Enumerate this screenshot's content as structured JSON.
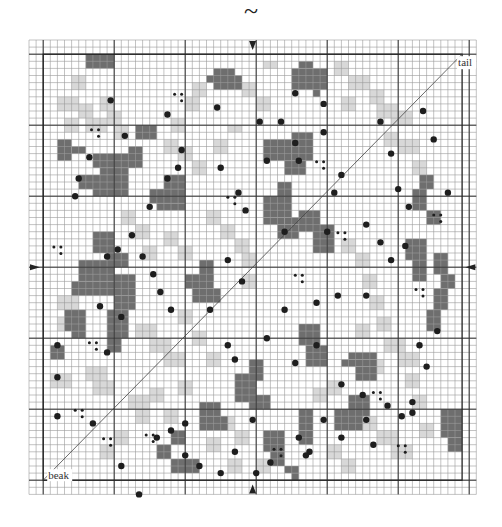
{
  "header": {
    "symbol": "~"
  },
  "labels": {
    "tail": "tail",
    "beak": "beak"
  },
  "colors": {
    "background": "#ffffff",
    "grid_line": "#9a9a9a",
    "grid_bold": "#333333",
    "dark_block": "#6e6e6e",
    "light_block": "#d8d8d8",
    "dot": "#1e1e1e",
    "marker": "#222222"
  },
  "grid": {
    "origin_x": 29,
    "origin_y": 40,
    "cell": 7.1,
    "cols": 63,
    "rows": 64,
    "inner_box": {
      "c0": 2,
      "r0": 2,
      "c1": 61,
      "r1": 62
    },
    "bold_every": 10,
    "bold_offset": 2
  },
  "markers": [
    {
      "side": "top",
      "col": 31.5
    },
    {
      "side": "bottom",
      "col": 31.5
    },
    {
      "side": "left",
      "row": 32
    },
    {
      "side": "right",
      "row": 32
    }
  ],
  "diagonal": {
    "from": {
      "c": 2,
      "r": 62
    },
    "to": {
      "c": 61,
      "r": 2
    }
  },
  "dark_blocks": [
    [
      8,
      2,
      4,
      2
    ],
    [
      10,
      2,
      2,
      1
    ],
    [
      25,
      5,
      2,
      1
    ],
    [
      26,
      4,
      3,
      3
    ],
    [
      29,
      5,
      1,
      2
    ],
    [
      37,
      4,
      5,
      3
    ],
    [
      38,
      3,
      2,
      1
    ],
    [
      40,
      7,
      1,
      1
    ],
    [
      4,
      14,
      2,
      3
    ],
    [
      6,
      15,
      2,
      1
    ],
    [
      9,
      16,
      6,
      2
    ],
    [
      10,
      18,
      4,
      1
    ],
    [
      14,
      15,
      2,
      3
    ],
    [
      15,
      12,
      3,
      2
    ],
    [
      37,
      13,
      3,
      4
    ],
    [
      33,
      14,
      4,
      3
    ],
    [
      36,
      17,
      3,
      2
    ],
    [
      7,
      19,
      7,
      2
    ],
    [
      9,
      21,
      5,
      1
    ],
    [
      17,
      21,
      5,
      2
    ],
    [
      19,
      19,
      3,
      2
    ],
    [
      18,
      23,
      4,
      1
    ],
    [
      33,
      22,
      4,
      3
    ],
    [
      35,
      20,
      2,
      2
    ],
    [
      33,
      25,
      3,
      1
    ],
    [
      36,
      25,
      3,
      1
    ],
    [
      35,
      26,
      3,
      2
    ],
    [
      9,
      27,
      3,
      3
    ],
    [
      11,
      30,
      3,
      2
    ],
    [
      12,
      33,
      3,
      3
    ],
    [
      12,
      36,
      3,
      2
    ],
    [
      38,
      24,
      3,
      3
    ],
    [
      40,
      26,
      3,
      4
    ],
    [
      7,
      31,
      5,
      3
    ],
    [
      6,
      34,
      6,
      2
    ],
    [
      22,
      33,
      4,
      2
    ],
    [
      24,
      31,
      2,
      3
    ],
    [
      23,
      35,
      4,
      2
    ],
    [
      54,
      21,
      2,
      3
    ],
    [
      55,
      19,
      2,
      2
    ],
    [
      56,
      24,
      2,
      2
    ],
    [
      53,
      28,
      3,
      3
    ],
    [
      54,
      31,
      2,
      3
    ],
    [
      57,
      30,
      2,
      3
    ],
    [
      58,
      33,
      2,
      2
    ],
    [
      5,
      38,
      3,
      3
    ],
    [
      6,
      41,
      2,
      1
    ],
    [
      11,
      38,
      3,
      4
    ],
    [
      11,
      42,
      2,
      2
    ],
    [
      3,
      43,
      2,
      2
    ],
    [
      38,
      40,
      3,
      3
    ],
    [
      39,
      43,
      3,
      3
    ],
    [
      45,
      44,
      4,
      1
    ],
    [
      44,
      45,
      5,
      1
    ],
    [
      46,
      46,
      3,
      2
    ],
    [
      56,
      38,
      2,
      3
    ],
    [
      57,
      35,
      2,
      3
    ],
    [
      43,
      52,
      4,
      3
    ],
    [
      45,
      50,
      3,
      3
    ],
    [
      29,
      47,
      3,
      4
    ],
    [
      31,
      45,
      2,
      3
    ],
    [
      31,
      50,
      3,
      2
    ],
    [
      24,
      51,
      3,
      2
    ],
    [
      24,
      53,
      4,
      2
    ],
    [
      20,
      55,
      2,
      2
    ],
    [
      33,
      55,
      3,
      3
    ],
    [
      34,
      58,
      2,
      2
    ],
    [
      36,
      60,
      2,
      1
    ],
    [
      37,
      61,
      1,
      1
    ],
    [
      20,
      59,
      4,
      2
    ],
    [
      18,
      57,
      2,
      2
    ],
    [
      38,
      52,
      2,
      3
    ],
    [
      38,
      55,
      2,
      2
    ],
    [
      58,
      52,
      3,
      4
    ],
    [
      59,
      56,
      2,
      2
    ]
  ],
  "light_blocks": [
    [
      6,
      5,
      2,
      2
    ],
    [
      4,
      8,
      3,
      2
    ],
    [
      7,
      9,
      2,
      2
    ],
    [
      8,
      11,
      3,
      2
    ],
    [
      5,
      11,
      2,
      2
    ],
    [
      10,
      8,
      2,
      2
    ],
    [
      11,
      10,
      2,
      2
    ],
    [
      12,
      12,
      2,
      2
    ],
    [
      23,
      6,
      2,
      2
    ],
    [
      22,
      8,
      2,
      2
    ],
    [
      20,
      11,
      2,
      2
    ],
    [
      30,
      6,
      2,
      2
    ],
    [
      33,
      3,
      2,
      1
    ],
    [
      32,
      8,
      2,
      2
    ],
    [
      43,
      3,
      2,
      2
    ],
    [
      45,
      5,
      3,
      2
    ],
    [
      44,
      8,
      2,
      2
    ],
    [
      48,
      7,
      2,
      2
    ],
    [
      49,
      9,
      3,
      2
    ],
    [
      51,
      10,
      3,
      2
    ],
    [
      52,
      14,
      3,
      2
    ],
    [
      50,
      13,
      2,
      2
    ],
    [
      54,
      17,
      2,
      2
    ],
    [
      19,
      14,
      2,
      2
    ],
    [
      21,
      15,
      2,
      2
    ],
    [
      23,
      17,
      2,
      2
    ],
    [
      26,
      14,
      2,
      2
    ],
    [
      28,
      12,
      2,
      1
    ],
    [
      13,
      24,
      2,
      2
    ],
    [
      15,
      26,
      2,
      2
    ],
    [
      16,
      29,
      2,
      2
    ],
    [
      19,
      27,
      2,
      2
    ],
    [
      21,
      29,
      2,
      2
    ],
    [
      25,
      24,
      2,
      2
    ],
    [
      27,
      26,
      2,
      2
    ],
    [
      29,
      28,
      2,
      2
    ],
    [
      30,
      30,
      2,
      2
    ],
    [
      30,
      33,
      2,
      2
    ],
    [
      44,
      28,
      2,
      2
    ],
    [
      46,
      30,
      2,
      2
    ],
    [
      47,
      33,
      2,
      2
    ],
    [
      48,
      36,
      2,
      2
    ],
    [
      49,
      39,
      2,
      2
    ],
    [
      4,
      36,
      3,
      2
    ],
    [
      4,
      39,
      2,
      2
    ],
    [
      3,
      47,
      3,
      2
    ],
    [
      8,
      46,
      3,
      2
    ],
    [
      9,
      48,
      3,
      2
    ],
    [
      15,
      40,
      3,
      2
    ],
    [
      17,
      42,
      3,
      2
    ],
    [
      19,
      44,
      3,
      2
    ],
    [
      21,
      38,
      2,
      2
    ],
    [
      23,
      41,
      2,
      2
    ],
    [
      25,
      44,
      2,
      2
    ],
    [
      50,
      42,
      3,
      2
    ],
    [
      52,
      44,
      3,
      2
    ],
    [
      53,
      47,
      2,
      2
    ],
    [
      46,
      40,
      2,
      2
    ],
    [
      48,
      45,
      2,
      2
    ],
    [
      17,
      49,
      2,
      2
    ],
    [
      19,
      52,
      2,
      2
    ],
    [
      21,
      48,
      2,
      2
    ],
    [
      25,
      56,
      2,
      2
    ],
    [
      27,
      53,
      2,
      2
    ],
    [
      29,
      55,
      2,
      2
    ],
    [
      12,
      55,
      2,
      2
    ],
    [
      10,
      57,
      2,
      2
    ],
    [
      14,
      50,
      3,
      2
    ],
    [
      15,
      52,
      2,
      2
    ],
    [
      40,
      49,
      2,
      2
    ],
    [
      42,
      48,
      2,
      2
    ],
    [
      47,
      53,
      2,
      2
    ],
    [
      49,
      55,
      3,
      2
    ],
    [
      51,
      57,
      3,
      2
    ],
    [
      54,
      50,
      2,
      2
    ],
    [
      55,
      54,
      2,
      2
    ],
    [
      32,
      59,
      2,
      2
    ],
    [
      28,
      59,
      2,
      2
    ],
    [
      42,
      57,
      2,
      2
    ],
    [
      44,
      59,
      2,
      2
    ]
  ],
  "dots": [
    [
      37.5,
      7.5
    ],
    [
      35.5,
      11.5
    ],
    [
      21.5,
      15.5
    ],
    [
      19.5,
      19.5
    ],
    [
      17,
      23.5
    ],
    [
      14.5,
      27.5
    ],
    [
      12.5,
      29.5
    ],
    [
      11,
      30.5
    ],
    [
      13.5,
      13.5
    ],
    [
      11.5,
      8.5
    ],
    [
      19.5,
      10.5
    ],
    [
      26.5,
      9.5
    ],
    [
      32.5,
      11.5
    ],
    [
      8.5,
      16.5
    ],
    [
      7,
      19.5
    ],
    [
      6.5,
      22
    ],
    [
      21,
      18
    ],
    [
      27,
      18
    ],
    [
      33.5,
      17
    ],
    [
      38,
      17
    ],
    [
      41.5,
      9
    ],
    [
      41.5,
      13
    ],
    [
      37.5,
      14.5
    ],
    [
      29.5,
      21.5
    ],
    [
      30.5,
      24
    ],
    [
      43,
      21.5
    ],
    [
      44,
      19
    ],
    [
      49.5,
      11.5
    ],
    [
      51,
      16
    ],
    [
      52,
      21
    ],
    [
      53.5,
      23.5
    ],
    [
      55.5,
      10
    ],
    [
      57,
      14
    ],
    [
      59,
      21.5
    ],
    [
      36,
      27
    ],
    [
      42,
      27
    ],
    [
      47.5,
      26
    ],
    [
      49.5,
      28.5
    ],
    [
      51,
      31
    ],
    [
      53,
      29
    ],
    [
      28,
      31
    ],
    [
      30,
      34
    ],
    [
      25.5,
      38
    ],
    [
      36,
      38
    ],
    [
      40.5,
      37
    ],
    [
      43.5,
      36
    ],
    [
      47.5,
      36
    ],
    [
      16,
      30.5
    ],
    [
      13,
      39
    ],
    [
      10,
      37.5
    ],
    [
      11,
      44
    ],
    [
      4,
      43
    ],
    [
      4,
      47.5
    ],
    [
      4,
      53
    ],
    [
      17.5,
      33
    ],
    [
      18.5,
      35.5
    ],
    [
      20,
      38
    ],
    [
      28,
      43
    ],
    [
      29,
      45
    ],
    [
      33.5,
      42
    ],
    [
      37.5,
      45.5
    ],
    [
      40.5,
      43
    ],
    [
      44,
      48.5
    ],
    [
      47,
      50
    ],
    [
      54,
      51
    ],
    [
      56,
      46
    ],
    [
      55,
      43
    ],
    [
      57.5,
      41
    ],
    [
      13,
      60
    ],
    [
      9,
      54
    ],
    [
      22,
      54
    ],
    [
      31.5,
      53.5
    ],
    [
      29,
      58
    ],
    [
      38,
      56
    ],
    [
      39.5,
      58
    ],
    [
      41.5,
      53.5
    ],
    [
      44,
      56
    ],
    [
      47.5,
      53.5
    ],
    [
      48.5,
      57
    ],
    [
      50.5,
      51.5
    ],
    [
      52.5,
      53
    ],
    [
      54,
      52.5
    ],
    [
      18,
      56
    ],
    [
      22,
      58.5
    ],
    [
      24,
      60
    ],
    [
      27,
      61
    ],
    [
      32,
      61
    ],
    [
      34,
      59.5
    ],
    [
      39,
      58.5
    ],
    [
      15.5,
      64
    ],
    [
      20,
      55
    ]
  ],
  "triplets": [
    [
      9.3,
      13
    ],
    [
      21,
      8
    ],
    [
      28.5,
      22.5
    ],
    [
      41,
      17.5
    ],
    [
      4,
      29.5
    ],
    [
      44,
      27.5
    ],
    [
      57.5,
      25
    ],
    [
      9,
      43
    ],
    [
      38,
      33.5
    ],
    [
      55,
      35.5
    ],
    [
      7,
      52.5
    ],
    [
      11,
      56.5
    ],
    [
      17,
      56
    ],
    [
      35,
      58
    ],
    [
      49,
      50
    ],
    [
      52.5,
      57.5
    ]
  ]
}
